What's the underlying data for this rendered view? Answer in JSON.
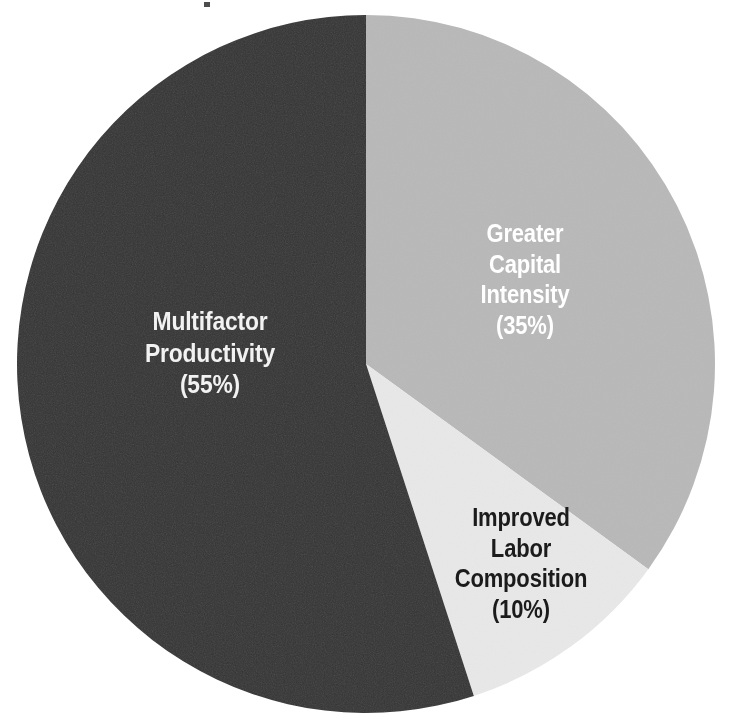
{
  "page": {
    "background_color": "#ffffff",
    "width": 745,
    "height": 727
  },
  "artifact": {
    "name": "scan-artifact",
    "note": ""
  },
  "chart_data": {
    "type": "pie",
    "title": "",
    "subtitle": "",
    "xlabel": "",
    "ylabel": "",
    "legend_position": "none",
    "grid": false,
    "labels_inside_slices": true,
    "start_angle_deg": 0,
    "direction": "clockwise",
    "categories": [
      "Greater Capital Intensity",
      "Improved Labor Composition",
      "Multifactor Productivity"
    ],
    "values": [
      35,
      10,
      55
    ],
    "value_unit": "%",
    "colors": [
      "#b8b8b8",
      "#e8e8e8",
      "#333333"
    ],
    "slices": [
      {
        "name": "Greater Capital Intensity",
        "value": 35,
        "value_label": "(35%)",
        "color": "#b8b8b8",
        "text_color": "#ffffff",
        "label_lines": [
          "Greater",
          "Capital",
          "Intensity"
        ],
        "start_angle_deg": 0,
        "end_angle_deg": 126
      },
      {
        "name": "Improved Labor Composition",
        "value": 10,
        "value_label": "(10%)",
        "color": "#e8e8e8",
        "text_color": "#1b1b1b",
        "label_lines": [
          "Improved",
          "Labor",
          "Composition"
        ],
        "start_angle_deg": 126,
        "end_angle_deg": 162
      },
      {
        "name": "Multifactor Productivity",
        "value": 55,
        "value_label": "(55%)",
        "color": "#333333",
        "text_color": "#f2f2f2",
        "label_lines": [
          "Multifactor",
          "Productivity"
        ],
        "start_angle_deg": 162,
        "end_angle_deg": 360
      }
    ]
  },
  "labels": {
    "multifactor": {
      "line1": "Multifactor",
      "line2": "Productivity",
      "value": "(55%)"
    },
    "capital": {
      "line1": "Greater",
      "line2": "Capital",
      "line3": "Intensity",
      "value": "(35%)"
    },
    "labor": {
      "line1": "Improved",
      "line2": "Labor",
      "line3": "Composition",
      "value": "(10%)"
    }
  }
}
